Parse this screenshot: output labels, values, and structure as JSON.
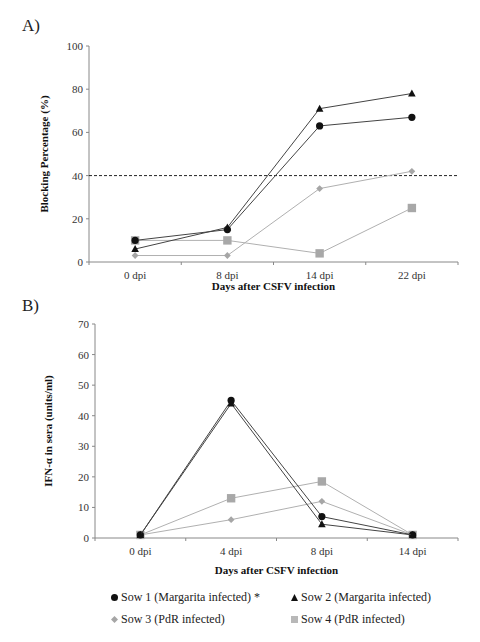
{
  "panel_a": {
    "label": "A)"
  },
  "panel_b": {
    "label": "B)"
  },
  "legend": {
    "items": [
      {
        "label": "Sow 1 (Margarita infected) *",
        "marker": "circle",
        "color": "#111111"
      },
      {
        "label": "Sow 2 (Margarita infected)",
        "marker": "triangle",
        "color": "#111111"
      },
      {
        "label": "Sow 3 (PdR infected)",
        "marker": "diamond",
        "color": "#a6a6a6"
      },
      {
        "label": "Sow 4 (PdR infected)",
        "marker": "square",
        "color": "#a6a6a6"
      }
    ]
  },
  "chart_data": [
    {
      "type": "line",
      "panel": "A)",
      "title": "",
      "xlabel": "Days after CSFV infection",
      "ylabel": "Blocking Percentage (%)",
      "categories": [
        "0 dpi",
        "8 dpi",
        "14 dpi",
        "22 dpi"
      ],
      "ylim": [
        0,
        100
      ],
      "yticks": [
        0,
        20,
        40,
        60,
        80,
        100
      ],
      "grid": false,
      "reference_line": {
        "y": 40,
        "style": "dashed",
        "color": "#222222"
      },
      "series": [
        {
          "name": "Sow 1 (Margarita infected) *",
          "marker": "circle",
          "color": "#111111",
          "values": [
            10,
            15,
            63,
            67
          ]
        },
        {
          "name": "Sow 2 (Margarita infected)",
          "marker": "triangle",
          "color": "#111111",
          "values": [
            6,
            16,
            71,
            78
          ]
        },
        {
          "name": "Sow 3 (PdR infected)",
          "marker": "diamond",
          "color": "#a6a6a6",
          "values": [
            3,
            3,
            34,
            42
          ]
        },
        {
          "name": "Sow 4 (PdR infected)",
          "marker": "square",
          "color": "#a6a6a6",
          "values": [
            10,
            10,
            4,
            25
          ]
        }
      ]
    },
    {
      "type": "line",
      "panel": "B)",
      "title": "",
      "xlabel": "Days after CSFV infection",
      "ylabel": "IFN-α in sera (units/ml)",
      "categories": [
        "0 dpi",
        "4 dpi",
        "8 dpi",
        "14 dpi"
      ],
      "ylim": [
        0,
        70
      ],
      "yticks": [
        0,
        10,
        20,
        30,
        40,
        50,
        60,
        70
      ],
      "grid": false,
      "legend_position": "bottom",
      "series": [
        {
          "name": "Sow 1 (Margarita infected) *",
          "marker": "circle",
          "color": "#111111",
          "values": [
            1,
            45,
            7,
            1
          ]
        },
        {
          "name": "Sow 2 (Margarita infected)",
          "marker": "triangle",
          "color": "#111111",
          "values": [
            1,
            44,
            4.5,
            1
          ]
        },
        {
          "name": "Sow 3 (PdR infected)",
          "marker": "diamond",
          "color": "#a6a6a6",
          "values": [
            1,
            6,
            12,
            1
          ]
        },
        {
          "name": "Sow 4 (PdR infected)",
          "marker": "square",
          "color": "#a6a6a6",
          "values": [
            1,
            13,
            18.5,
            1
          ]
        }
      ]
    }
  ]
}
